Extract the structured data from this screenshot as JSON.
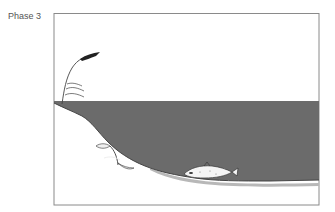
{
  "figure": {
    "phase_label": "Phase 3",
    "concentration": {
      "text": "≤1000 µg l",
      "exponent": "−1"
    },
    "colors": {
      "frame": "#8a8a8a",
      "water": "#6b6b6b",
      "sediment_band": "#b8b8b8",
      "shore_outline": "#444444",
      "fish_body": "#f4f4f4",
      "text": "#555555"
    },
    "elements": [
      {
        "name": "reed-plant",
        "description": "reed grass on shoreline"
      },
      {
        "name": "water-body",
        "description": "dark grey lake water"
      },
      {
        "name": "dead-plants",
        "description": "wilted plants on slope"
      },
      {
        "name": "dead-fish",
        "description": "fish lying on lake bottom"
      },
      {
        "name": "sediment",
        "description": "lake bottom sediment band"
      }
    ]
  }
}
